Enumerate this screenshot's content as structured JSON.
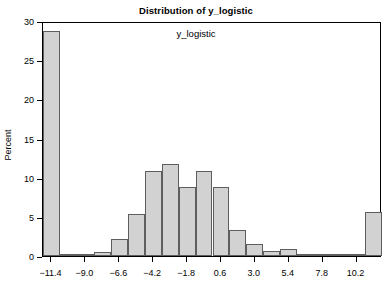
{
  "chart_data": {
    "type": "bar",
    "title": "Distribution of y_logistic",
    "xlabel": "y_logistic",
    "ylabel": "Percent",
    "grid": false,
    "legend": null,
    "xlim": [
      -12.0,
      12.0
    ],
    "ylim": [
      0,
      30
    ],
    "ytick_labels": [
      "0",
      "5",
      "10",
      "15",
      "20",
      "25",
      "30"
    ],
    "ytick_values": [
      0,
      5,
      10,
      15,
      20,
      25,
      30
    ],
    "xtick_labels": [
      "-11.4",
      "-9.0",
      "-6.6",
      "-4.2",
      "-1.8",
      "0.6",
      "3.0",
      "5.4",
      "7.8",
      "10.2"
    ],
    "xtick_values": [
      -11.4,
      -9.0,
      -6.6,
      -4.2,
      -1.8,
      0.6,
      3.0,
      5.4,
      7.8,
      10.2
    ],
    "bin_width": 1.2,
    "categories": [
      -11.4,
      -10.2,
      -9.0,
      -7.8,
      -6.6,
      -5.4,
      -4.2,
      -3.0,
      -1.8,
      -0.6,
      0.6,
      1.8,
      3.0,
      4.2,
      5.4,
      6.6,
      7.8,
      9.0,
      10.2,
      11.4
    ],
    "values": [
      28.7,
      0.2,
      0.1,
      0.5,
      2.2,
      5.3,
      10.9,
      11.7,
      8.8,
      10.9,
      8.8,
      3.3,
      1.5,
      0.6,
      0.9,
      0.1,
      0.1,
      0.1,
      0.1,
      5.6
    ],
    "bars": [
      {
        "center": -11.4,
        "value": 28.7
      },
      {
        "center": -10.2,
        "value": 0.2
      },
      {
        "center": -9.0,
        "value": 0.1
      },
      {
        "center": -7.8,
        "value": 0.5
      },
      {
        "center": -6.6,
        "value": 2.2
      },
      {
        "center": -5.4,
        "value": 5.3
      },
      {
        "center": -4.2,
        "value": 10.9
      },
      {
        "center": -3.0,
        "value": 11.7
      },
      {
        "center": -1.8,
        "value": 8.8
      },
      {
        "center": -0.6,
        "value": 10.9
      },
      {
        "center": 0.6,
        "value": 8.8
      },
      {
        "center": 1.8,
        "value": 3.3
      },
      {
        "center": 3.0,
        "value": 1.5
      },
      {
        "center": 4.2,
        "value": 0.6
      },
      {
        "center": 5.4,
        "value": 0.9
      },
      {
        "center": 6.6,
        "value": 0.1
      },
      {
        "center": 7.8,
        "value": 0.1
      },
      {
        "center": 9.0,
        "value": 0.1
      },
      {
        "center": 10.2,
        "value": 0.1
      },
      {
        "center": 11.4,
        "value": 5.6
      }
    ],
    "colors": {
      "bar_fill": "#d2d2d2",
      "bar_border": "#5e5e5e",
      "axis": "#000000",
      "background": "#ffffff",
      "text": "#000000"
    }
  }
}
